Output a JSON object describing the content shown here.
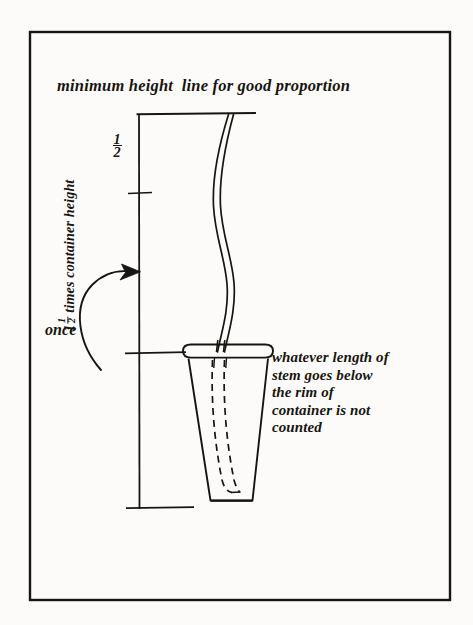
{
  "figure": {
    "background_color": "#fcfbfa",
    "ink_color": "#17150f",
    "border": {
      "name": "figure-frame",
      "x": 30,
      "y": 32,
      "width": 420,
      "height": 568,
      "stroke_width": 2.4
    },
    "title": "minimum height  line for good proportion",
    "once_label": "once",
    "caption_lines": [
      "whatever length of",
      "stem goes below",
      "the rim of",
      "container is not",
      "counted"
    ],
    "caption_text": "whatever length of\nstem goes below\nthe rim of\ncontainer is not\ncounted",
    "dimension": {
      "label_prefix": "1",
      "label_fraction_numerator": "1",
      "label_fraction_denominator": "2",
      "label_suffix": " times container height",
      "full_label": "1 1/2 times container height",
      "half_mark_numerator": "1",
      "half_mark_denominator": "2",
      "half_mark": "1/2",
      "top_line_y": 114,
      "mid_tick_y": 193,
      "rim_tick_y": 353,
      "bottom_tick_y": 508,
      "axis_x": 139
    },
    "container": {
      "name": "vase-container",
      "rim_y": 353,
      "base_y": 500,
      "rim_left": 186,
      "rim_right": 270,
      "base_left": 212,
      "base_right": 252
    },
    "stem": {
      "name": "flower-stem",
      "top_y": 115,
      "enters_rim_y": 350,
      "ends_y": 492,
      "style": "s-curve double line, dashed below rim"
    },
    "arrow": {
      "name": "once-curved-arrow",
      "tip_x": 139,
      "tip_y": 272,
      "direction": "up-right"
    }
  }
}
